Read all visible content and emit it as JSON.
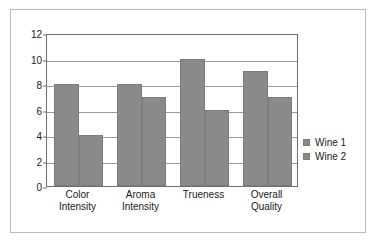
{
  "chart_data": {
    "type": "bar",
    "title": "",
    "subtitle": "",
    "xlabel": "",
    "ylabel": "",
    "ylim": [
      0,
      12
    ],
    "ytick_step": 2,
    "yticks": [
      0,
      2,
      4,
      6,
      8,
      10,
      12
    ],
    "ytick_labels": [
      "0",
      "2",
      "4",
      "6",
      "8",
      "10",
      "12"
    ],
    "grid": true,
    "grid_axis": "y",
    "legend_position": "right",
    "categories": [
      "Color Intensity",
      "Aroma Intensity",
      "Trueness",
      "Overall Quality"
    ],
    "category_label_lines": [
      [
        "Color",
        "Intensity"
      ],
      [
        "Aroma",
        "Intensity"
      ],
      [
        "Trueness",
        ""
      ],
      [
        "Overall",
        "Quality"
      ]
    ],
    "series": [
      {
        "name": "Wine 1",
        "values": [
          8,
          8,
          10,
          9
        ],
        "color": "#8a8a8a"
      },
      {
        "name": "Wine 2",
        "values": [
          4,
          7,
          6,
          7
        ],
        "color": "#8a8a8a"
      }
    ]
  },
  "legend": {
    "items": [
      {
        "label": "Wine 1",
        "color": "#8a8a8a"
      },
      {
        "label": "Wine 2",
        "color": "#8a8a8a"
      }
    ]
  },
  "style": {
    "background": "#ffffff",
    "frame_border": "#b9b9b9",
    "axis_color": "#6e6e6e",
    "gridline_color": "#9a9a9a",
    "bar_color": "#8a8a8a",
    "bar_border": "#7c7c7c",
    "text_color": "#1a1a1a"
  }
}
